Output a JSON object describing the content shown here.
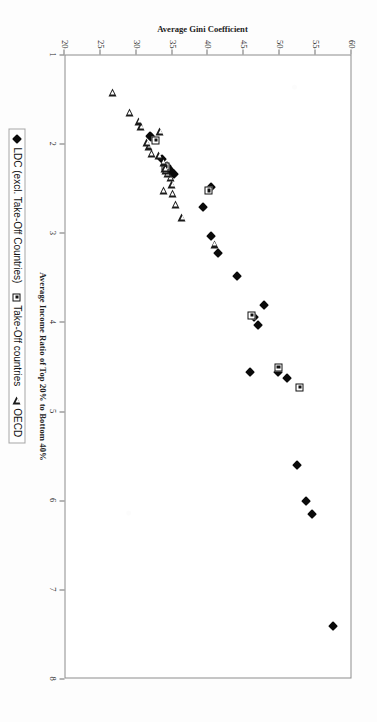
{
  "chart_data": {
    "type": "scatter",
    "title": "",
    "xlabel": "Average Income Ratio of Top 20% to Bottom 40%",
    "ylabel": "Average Gini Coefficient",
    "xlim": [
      1,
      8
    ],
    "ylim": [
      20,
      60
    ],
    "xticks": [
      "1",
      "2",
      "3",
      "4",
      "5",
      "6",
      "7",
      "8"
    ],
    "yticks": [
      "20",
      "25",
      "30",
      "35",
      "40",
      "45",
      "50",
      "55",
      "60"
    ],
    "grid": false,
    "legend_position": "bottom",
    "series": [
      {
        "name": "LDC (excl. Take-Off Countries)",
        "marker": "filled-diamond",
        "color": "#0a0a0a",
        "points": [
          [
            7.4,
            57.6
          ],
          [
            6.15,
            54.6
          ],
          [
            6.0,
            53.8
          ],
          [
            5.6,
            52.6
          ],
          [
            4.62,
            51.2
          ],
          [
            4.55,
            49.9
          ],
          [
            4.55,
            46.0
          ],
          [
            4.02,
            47.1
          ],
          [
            3.93,
            46.6
          ],
          [
            3.8,
            47.9
          ],
          [
            3.48,
            44.2
          ],
          [
            3.22,
            41.5
          ],
          [
            3.03,
            40.6
          ],
          [
            2.7,
            39.4
          ],
          [
            2.48,
            40.5
          ],
          [
            2.33,
            35.4
          ],
          [
            2.31,
            35.0
          ],
          [
            2.28,
            34.8
          ],
          [
            2.26,
            34.6
          ],
          [
            2.24,
            34.4
          ],
          [
            2.16,
            33.7
          ],
          [
            1.92,
            32.2
          ],
          [
            1.9,
            32.0
          ]
        ]
      },
      {
        "name": "Take-Off countries",
        "marker": "square-dot",
        "color": "#111111",
        "points": [
          [
            4.72,
            52.9
          ],
          [
            4.5,
            49.9
          ],
          [
            3.92,
            46.2
          ],
          [
            2.52,
            40.2
          ],
          [
            2.25,
            34.2
          ],
          [
            1.95,
            32.8
          ]
        ]
      },
      {
        "name": "OECD",
        "marker": "open-triangle",
        "color": "#1a1a1a",
        "points": [
          [
            3.12,
            41.0
          ],
          [
            2.82,
            36.5
          ],
          [
            2.68,
            35.6
          ],
          [
            2.55,
            35.2
          ],
          [
            2.52,
            33.9
          ],
          [
            2.45,
            35.1
          ],
          [
            2.37,
            34.9
          ],
          [
            2.33,
            34.5
          ],
          [
            2.3,
            34.2
          ],
          [
            2.27,
            34.1
          ],
          [
            2.2,
            33.9
          ],
          [
            2.13,
            33.3
          ],
          [
            2.1,
            32.2
          ],
          [
            2.02,
            31.9
          ],
          [
            1.98,
            31.6
          ],
          [
            1.86,
            33.4
          ],
          [
            1.8,
            30.8
          ],
          [
            1.74,
            30.5
          ],
          [
            1.64,
            29.2
          ],
          [
            1.42,
            26.8
          ]
        ]
      }
    ]
  },
  "legend": {
    "items": [
      {
        "label": "LDC (excl. Take-Off Countries)",
        "marker": "filled-diamond"
      },
      {
        "label": "Take-Off countries",
        "marker": "square-dot"
      },
      {
        "label": "OECD",
        "marker": "open-triangle"
      }
    ]
  }
}
